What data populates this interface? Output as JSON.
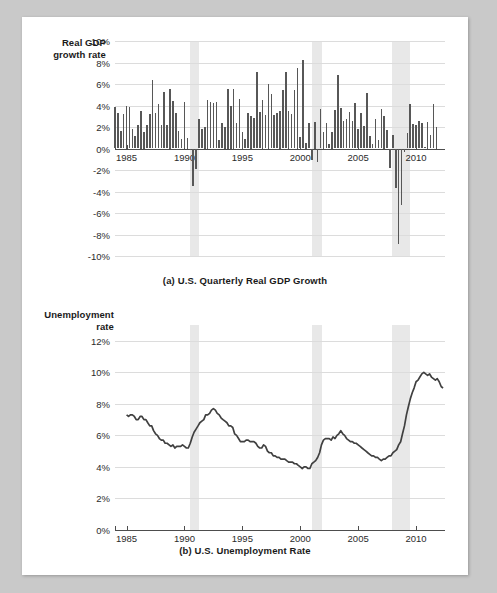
{
  "page": {
    "background_color": "#c9c9c9",
    "paper_color": "#ffffff"
  },
  "figure_a": {
    "y_axis_label_line1": "Real GDP",
    "y_axis_label_line2": "growth rate",
    "caption": "(a) U.S. Quarterly Real GDP Growth"
  },
  "figure_b": {
    "y_axis_label_line1": "Unemployment",
    "y_axis_label_line2": "rate",
    "caption": "(b) U.S. Unemployment Rate"
  },
  "chart_data": [
    {
      "type": "bar",
      "title": "(a) U.S. Quarterly Real GDP Growth",
      "xlabel": "",
      "ylabel": "Real GDP growth rate",
      "ylim": [
        -10,
        10
      ],
      "xlim": [
        1984.0,
        2012.5
      ],
      "grid": true,
      "legend": "none",
      "y_ticks": [
        "10%",
        "8%",
        "6%",
        "4%",
        "2%",
        "0%",
        "-2%",
        "-4%",
        "-6%",
        "-8%",
        "-10%"
      ],
      "y_tick_values": [
        10,
        8,
        6,
        4,
        2,
        0,
        -2,
        -4,
        -6,
        -8,
        -10
      ],
      "x_ticks": [
        "1985",
        "1990",
        "1995",
        "2000",
        "2005",
        "2010"
      ],
      "x_tick_values": [
        1985,
        1990,
        1995,
        2000,
        2005,
        2010
      ],
      "bar_color": "#575757",
      "recession_bands": [
        {
          "start": 1990.5,
          "end": 1991.25
        },
        {
          "start": 2001.0,
          "end": 2001.85
        },
        {
          "start": 2007.95,
          "end": 2009.5
        }
      ],
      "x": [
        1984.0,
        1984.25,
        1984.5,
        1984.75,
        1985.0,
        1985.25,
        1985.5,
        1985.75,
        1986.0,
        1986.25,
        1986.5,
        1986.75,
        1987.0,
        1987.25,
        1987.5,
        1987.75,
        1988.0,
        1988.25,
        1988.5,
        1988.75,
        1989.0,
        1989.25,
        1989.5,
        1989.75,
        1990.0,
        1990.25,
        1990.5,
        1990.75,
        1991.0,
        1991.25,
        1991.5,
        1991.75,
        1992.0,
        1992.25,
        1992.5,
        1992.75,
        1993.0,
        1993.25,
        1993.5,
        1993.75,
        1994.0,
        1994.25,
        1994.5,
        1994.75,
        1995.0,
        1995.25,
        1995.5,
        1995.75,
        1996.0,
        1996.25,
        1996.5,
        1996.75,
        1997.0,
        1997.25,
        1997.5,
        1997.75,
        1998.0,
        1998.25,
        1998.5,
        1998.75,
        1999.0,
        1999.25,
        1999.5,
        1999.75,
        2000.0,
        2000.25,
        2000.5,
        2000.75,
        2001.0,
        2001.25,
        2001.5,
        2001.75,
        2002.0,
        2002.25,
        2002.5,
        2002.75,
        2003.0,
        2003.25,
        2003.5,
        2003.75,
        2004.0,
        2004.25,
        2004.5,
        2004.75,
        2005.0,
        2005.25,
        2005.5,
        2005.75,
        2006.0,
        2006.25,
        2006.5,
        2006.75,
        2007.0,
        2007.25,
        2007.5,
        2007.75,
        2008.0,
        2008.25,
        2008.5,
        2008.75,
        2009.0,
        2009.25,
        2009.5,
        2009.75,
        2010.0,
        2010.25,
        2010.5,
        2010.75,
        2011.0,
        2011.25,
        2011.5,
        2011.75,
        2012.0,
        2012.25
      ],
      "values": [
        3.9,
        3.3,
        1.6,
        3.2,
        4.0,
        3.9,
        1.8,
        1.2,
        2.2,
        3.5,
        1.5,
        2.2,
        3.2,
        6.4,
        3.3,
        4.1,
        2.2,
        5.3,
        2.2,
        5.5,
        4.4,
        3.3,
        1.6,
        0.9,
        4.3,
        1.0,
        -0.1,
        -3.5,
        -1.9,
        2.7,
        1.8,
        2.0,
        4.5,
        4.3,
        4.2,
        4.3,
        0.8,
        2.4,
        2.0,
        5.5,
        4.0,
        5.5,
        2.4,
        4.6,
        1.5,
        0.9,
        3.3,
        3.0,
        2.8,
        7.1,
        3.4,
        4.5,
        3.1,
        6.0,
        5.1,
        3.1,
        3.3,
        3.5,
        5.4,
        7.1,
        3.5,
        3.2,
        5.4,
        7.5,
        1.1,
        8.2,
        0.5,
        2.4,
        -1.1,
        2.5,
        -1.3,
        3.7,
        1.5,
        2.4,
        0.4,
        1.5,
        3.6,
        6.8,
        3.8,
        2.6,
        2.7,
        3.4,
        2.6,
        4.2,
        1.8,
        3.3,
        2.1,
        5.2,
        1.2,
        0.4,
        2.7,
        0.8,
        3.7,
        3.0,
        1.7,
        -1.8,
        1.3,
        -3.7,
        -8.9,
        -5.3,
        -0.3,
        1.4,
        4.1,
        2.3,
        2.2,
        2.6,
        2.4,
        0.1,
        2.5,
        1.3,
        4.1,
        2.0
      ]
    },
    {
      "type": "line",
      "title": "(b) U.S. Unemployment Rate",
      "xlabel": "",
      "ylabel": "Unemployment rate",
      "ylim": [
        0,
        13
      ],
      "xlim": [
        1984.0,
        2012.5
      ],
      "grid": true,
      "legend": "none",
      "y_ticks": [
        "12%",
        "10%",
        "8%",
        "6%",
        "4%",
        "2%",
        "0%"
      ],
      "y_tick_values": [
        12,
        10,
        8,
        6,
        4,
        2,
        0
      ],
      "x_ticks": [
        "1985",
        "1990",
        "1995",
        "2000",
        "2005",
        "2010"
      ],
      "x_tick_values": [
        1985,
        1990,
        1995,
        2000,
        2005,
        2010
      ],
      "line_color": "#404040",
      "recession_bands": [
        {
          "start": 1990.5,
          "end": 1991.25
        },
        {
          "start": 2001.0,
          "end": 2001.85
        },
        {
          "start": 2007.95,
          "end": 2009.5
        }
      ],
      "x": [
        1985.0,
        1985.17,
        1985.33,
        1985.5,
        1985.67,
        1985.83,
        1986.0,
        1986.17,
        1986.33,
        1986.5,
        1986.67,
        1986.83,
        1987.0,
        1987.17,
        1987.33,
        1987.5,
        1987.67,
        1987.83,
        1988.0,
        1988.17,
        1988.33,
        1988.5,
        1988.67,
        1988.83,
        1989.0,
        1989.17,
        1989.33,
        1989.5,
        1989.67,
        1989.83,
        1990.0,
        1990.17,
        1990.33,
        1990.5,
        1990.67,
        1990.83,
        1991.0,
        1991.17,
        1991.33,
        1991.5,
        1991.67,
        1991.83,
        1992.0,
        1992.17,
        1992.33,
        1992.5,
        1992.67,
        1992.83,
        1993.0,
        1993.17,
        1993.33,
        1993.5,
        1993.67,
        1993.83,
        1994.0,
        1994.17,
        1994.33,
        1994.5,
        1994.67,
        1994.83,
        1995.0,
        1995.17,
        1995.33,
        1995.5,
        1995.67,
        1995.83,
        1996.0,
        1996.17,
        1996.33,
        1996.5,
        1996.67,
        1996.83,
        1997.0,
        1997.17,
        1997.33,
        1997.5,
        1997.67,
        1997.83,
        1998.0,
        1998.17,
        1998.33,
        1998.5,
        1998.67,
        1998.83,
        1999.0,
        1999.17,
        1999.33,
        1999.5,
        1999.67,
        1999.83,
        2000.0,
        2000.17,
        2000.33,
        2000.5,
        2000.67,
        2000.83,
        2001.0,
        2001.17,
        2001.33,
        2001.5,
        2001.67,
        2001.83,
        2002.0,
        2002.17,
        2002.33,
        2002.5,
        2002.67,
        2002.83,
        2003.0,
        2003.17,
        2003.33,
        2003.5,
        2003.67,
        2003.83,
        2004.0,
        2004.17,
        2004.33,
        2004.5,
        2004.67,
        2004.83,
        2005.0,
        2005.17,
        2005.33,
        2005.5,
        2005.67,
        2005.83,
        2006.0,
        2006.17,
        2006.33,
        2006.5,
        2006.67,
        2006.83,
        2007.0,
        2007.17,
        2007.33,
        2007.5,
        2007.67,
        2007.83,
        2008.0,
        2008.17,
        2008.33,
        2008.5,
        2008.67,
        2008.83,
        2009.0,
        2009.17,
        2009.33,
        2009.5,
        2009.67,
        2009.83,
        2010.0,
        2010.17,
        2010.33,
        2010.5,
        2010.67,
        2010.83,
        2011.0,
        2011.17,
        2011.33,
        2011.5,
        2011.67,
        2011.83,
        2012.0,
        2012.17,
        2012.33
      ],
      "values": [
        7.3,
        7.2,
        7.3,
        7.3,
        7.2,
        7.0,
        7.0,
        7.2,
        7.2,
        7.0,
        7.0,
        6.8,
        6.6,
        6.6,
        6.3,
        6.1,
        6.0,
        5.8,
        5.7,
        5.7,
        5.5,
        5.5,
        5.4,
        5.3,
        5.4,
        5.2,
        5.3,
        5.3,
        5.3,
        5.4,
        5.3,
        5.2,
        5.2,
        5.5,
        5.9,
        6.2,
        6.4,
        6.6,
        6.8,
        6.9,
        7.0,
        7.3,
        7.3,
        7.4,
        7.6,
        7.7,
        7.6,
        7.4,
        7.3,
        7.1,
        7.0,
        6.9,
        6.8,
        6.6,
        6.6,
        6.5,
        6.1,
        6.0,
        5.8,
        5.6,
        5.6,
        5.6,
        5.7,
        5.7,
        5.6,
        5.6,
        5.6,
        5.5,
        5.3,
        5.2,
        5.2,
        5.4,
        5.3,
        5.0,
        4.9,
        4.9,
        4.7,
        4.7,
        4.6,
        4.6,
        4.5,
        4.5,
        4.5,
        4.4,
        4.3,
        4.3,
        4.3,
        4.2,
        4.2,
        4.1,
        4.0,
        3.9,
        4.0,
        4.0,
        3.9,
        3.9,
        4.2,
        4.3,
        4.4,
        4.6,
        4.9,
        5.4,
        5.7,
        5.8,
        5.8,
        5.8,
        5.7,
        5.9,
        5.8,
        6.0,
        6.1,
        6.3,
        6.1,
        6.0,
        5.8,
        5.7,
        5.6,
        5.6,
        5.5,
        5.5,
        5.4,
        5.3,
        5.2,
        5.1,
        5.0,
        4.9,
        4.8,
        4.7,
        4.7,
        4.6,
        4.6,
        4.5,
        4.4,
        4.5,
        4.5,
        4.6,
        4.7,
        4.7,
        4.9,
        5.0,
        5.1,
        5.4,
        5.6,
        6.1,
        6.6,
        7.3,
        7.8,
        8.3,
        8.7,
        9.0,
        9.4,
        9.5,
        9.7,
        9.9,
        10.0,
        9.9,
        9.8,
        9.9,
        9.7,
        9.6,
        9.5,
        9.6,
        9.4,
        9.1,
        9.0,
        9.0,
        9.1,
        9.0,
        8.9,
        8.7,
        8.5,
        8.3,
        8.2
      ]
    }
  ]
}
